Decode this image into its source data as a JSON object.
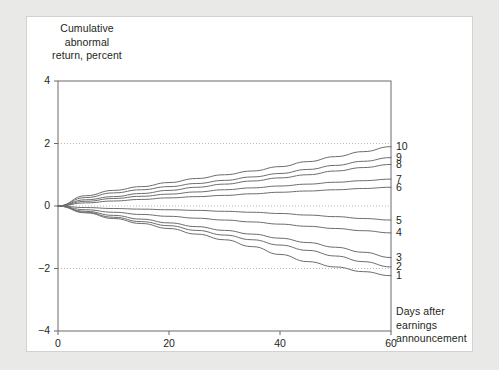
{
  "figure": {
    "background_color": "#e9e9e7",
    "card_color": "#ffffff",
    "line_color": "#6d6d6d",
    "axis_color": "#6b6b6b",
    "grid_color": "#b9b9b9",
    "text_color": "#231f20"
  },
  "chart_data": {
    "type": "line",
    "title": "",
    "ylabel": "Cumulative\nabnormal\nreturn, percent",
    "xlabel": "Days after\nearnings\nannouncement",
    "xlim": [
      0,
      60
    ],
    "ylim": [
      -4,
      4
    ],
    "xticks": [
      0,
      20,
      40,
      60
    ],
    "xtick_labels": [
      "0",
      "20",
      "40",
      "60"
    ],
    "yticks": [
      4,
      2,
      0,
      -2,
      -4
    ],
    "ytick_labels": [
      "4",
      "2",
      "0",
      "−2",
      "−4"
    ],
    "grid": "horizontal dotted gridlines at y = 2, 0, -2",
    "gridlines": [
      2,
      0,
      -2
    ],
    "legend_position": "right-edge inline labels",
    "x": [
      0,
      5,
      10,
      15,
      20,
      25,
      30,
      35,
      40,
      45,
      50,
      55,
      60
    ],
    "series": [
      {
        "name": "10",
        "label": "10",
        "end_value": 1.9,
        "values": [
          0,
          0.33,
          0.5,
          0.62,
          0.75,
          0.88,
          1.0,
          1.12,
          1.26,
          1.42,
          1.58,
          1.74,
          1.9
        ]
      },
      {
        "name": "9",
        "label": "9",
        "end_value": 1.55,
        "values": [
          0,
          0.27,
          0.42,
          0.52,
          0.62,
          0.72,
          0.82,
          0.93,
          1.04,
          1.17,
          1.3,
          1.43,
          1.55
        ]
      },
      {
        "name": "8",
        "label": "8",
        "end_value": 1.33,
        "values": [
          0,
          0.2,
          0.3,
          0.4,
          0.5,
          0.6,
          0.7,
          0.8,
          0.9,
          1.0,
          1.12,
          1.23,
          1.33
        ]
      },
      {
        "name": "7",
        "label": "7",
        "end_value": 0.86,
        "values": [
          0,
          0.15,
          0.24,
          0.31,
          0.38,
          0.45,
          0.52,
          0.58,
          0.64,
          0.7,
          0.76,
          0.81,
          0.86
        ]
      },
      {
        "name": "6",
        "label": "6",
        "end_value": 0.6,
        "values": [
          0,
          0.1,
          0.16,
          0.21,
          0.26,
          0.3,
          0.34,
          0.39,
          0.44,
          0.48,
          0.52,
          0.56,
          0.6
        ]
      },
      {
        "name": "5",
        "label": "5",
        "end_value": -0.45,
        "values": [
          0,
          -0.05,
          -0.08,
          -0.1,
          -0.12,
          -0.14,
          -0.17,
          -0.2,
          -0.24,
          -0.29,
          -0.34,
          -0.4,
          -0.45
        ]
      },
      {
        "name": "4",
        "label": "4",
        "end_value": -0.86,
        "values": [
          0,
          -0.12,
          -0.2,
          -0.27,
          -0.33,
          -0.39,
          -0.45,
          -0.51,
          -0.58,
          -0.65,
          -0.72,
          -0.79,
          -0.86
        ]
      },
      {
        "name": "3",
        "label": "3",
        "end_value": -1.65,
        "values": [
          0,
          -0.17,
          -0.3,
          -0.42,
          -0.54,
          -0.66,
          -0.78,
          -0.9,
          -1.03,
          -1.17,
          -1.32,
          -1.48,
          -1.65
        ]
      },
      {
        "name": "2",
        "label": "2",
        "end_value": -1.95,
        "values": [
          0,
          -0.2,
          -0.36,
          -0.5,
          -0.63,
          -0.78,
          -0.93,
          -1.08,
          -1.25,
          -1.42,
          -1.6,
          -1.78,
          -1.95
        ]
      },
      {
        "name": "1",
        "label": "1",
        "end_value": -2.23,
        "values": [
          0,
          -0.22,
          -0.4,
          -0.56,
          -0.72,
          -0.9,
          -1.08,
          -1.3,
          -1.55,
          -1.78,
          -1.95,
          -2.1,
          -2.23
        ]
      }
    ]
  }
}
